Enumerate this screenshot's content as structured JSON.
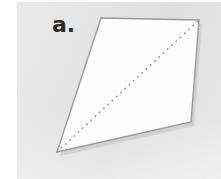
{
  "figure": {
    "label": "a.",
    "panel": {
      "background_color": "#e3e3e3",
      "x": 17,
      "y": 2,
      "width": 204,
      "height": 177
    },
    "page_background_color": "#ffffff",
    "shape": {
      "name": "quadrilateral",
      "fill_color": "#fefefe",
      "stroke_color": "#9a9a9a",
      "stroke_width": 1.4,
      "shadow_color": "#c4c4c4",
      "vertices": [
        {
          "id": "top-left",
          "x": 101,
          "y": 18
        },
        {
          "id": "top-right",
          "x": 199,
          "y": 20
        },
        {
          "id": "bottom-right",
          "x": 191,
          "y": 122
        },
        {
          "id": "bottom-left",
          "x": 57,
          "y": 152
        }
      ],
      "points_attr": "101,18 199,20 191,122 57,152"
    },
    "diagonal": {
      "name": "dotted-diagonal",
      "from": {
        "id": "bottom-left",
        "x": 57,
        "y": 152
      },
      "to": {
        "id": "top-right",
        "x": 199,
        "y": 20
      },
      "stroke_color": "#8f8f8f",
      "stroke_width": 1.5,
      "dash_array": "0.6 5.2",
      "line_cap": "round"
    }
  }
}
